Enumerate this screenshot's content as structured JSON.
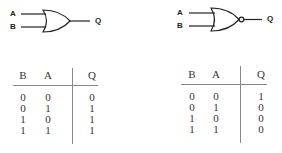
{
  "gates": [
    {
      "type": "OR",
      "inputs": [
        "A",
        "B"
      ],
      "output": "Q",
      "truth_table": {
        "headers": [
          "B",
          "A",
          "Q"
        ],
        "rows": [
          [
            "0",
            "0",
            "0"
          ],
          [
            "0",
            "1",
            "1"
          ],
          [
            "1",
            "0",
            "1"
          ],
          [
            "1",
            "1",
            "1"
          ]
        ]
      }
    },
    {
      "type": "NOR",
      "inputs": [
        "A",
        "B"
      ],
      "output": "Q",
      "truth_table": {
        "headers": [
          "B",
          "A",
          "Q"
        ],
        "rows": [
          [
            "0",
            "0",
            "1"
          ],
          [
            "0",
            "1",
            "0"
          ],
          [
            "1",
            "0",
            "0"
          ],
          [
            "1",
            "1",
            "0"
          ]
        ]
      }
    }
  ]
}
